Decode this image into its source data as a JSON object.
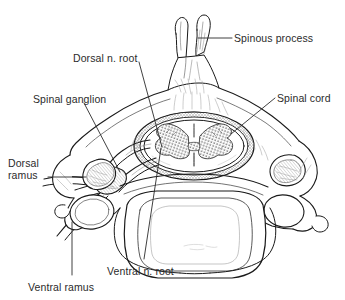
{
  "figure": {
    "background_color": "#ffffff",
    "ink_color": "#1a1a1a",
    "label_color": "#2b2b2b",
    "shading_gray": "#8e8e8e",
    "light_gray": "#c9c9c9"
  },
  "labels": [
    {
      "id": "spinous-process",
      "text": "Spinous process",
      "x": 234,
      "y": 32,
      "align": "left",
      "leader": {
        "points": "198,38 232,38"
      }
    },
    {
      "id": "dorsal-n-root",
      "text": "Dorsal n. root",
      "x": 73,
      "y": 52,
      "align": "left",
      "leader": {
        "points": "139,62 162,147"
      }
    },
    {
      "id": "spinal-ganglion",
      "text": "Spinal ganglion",
      "x": 33,
      "y": 93,
      "align": "left",
      "leader": {
        "points": "84,103 120,172"
      }
    },
    {
      "id": "spinal-cord",
      "text": "Spinal cord",
      "x": 277,
      "y": 92,
      "align": "left",
      "leader": {
        "points": "275,98 231,134"
      }
    },
    {
      "id": "dorsal-ramus",
      "text": "Dorsal\nramus",
      "x": 8,
      "y": 157,
      "align": "left",
      "leader": {
        "points": "48,177 86,177"
      }
    },
    {
      "id": "ventral-n-root",
      "text": "Ventral n. root",
      "x": 107,
      "y": 265,
      "align": "left",
      "leader": {
        "points": "161,148 144,259"
      }
    },
    {
      "id": "ventral-ramus",
      "text": "Ventral ramus",
      "x": 28,
      "y": 281,
      "align": "left",
      "leader": {
        "points": "72,222 72,275"
      }
    }
  ],
  "anatomy": {
    "parts": [
      "spinous-process",
      "vertebral-lamina",
      "spinal-cord",
      "gray-matter",
      "dura-mater",
      "dorsal-nerve-root",
      "spinal-ganglion",
      "ventral-nerve-root",
      "dorsal-ramus",
      "ventral-ramus",
      "transverse-process",
      "transverse-foramen",
      "superior-articular-facet",
      "vertebral-body"
    ]
  }
}
